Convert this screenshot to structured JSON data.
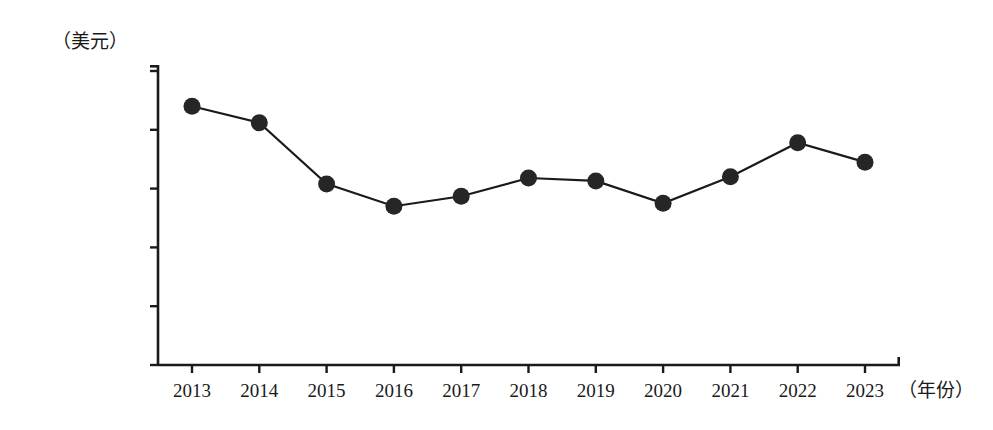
{
  "chart_data": {
    "type": "line",
    "title": "",
    "subtitle": "",
    "xlabel": "（年份）",
    "ylabel": "（美元）",
    "categories": [
      "2013",
      "2014",
      "2015",
      "2016",
      "2017",
      "2018",
      "2019",
      "2020",
      "2021",
      "2022",
      "2023"
    ],
    "values": [
      44000.0,
      41200.0,
      30800.0,
      27000.0,
      28700.0,
      31800.0,
      31300.0,
      27500.0,
      32000.0,
      37800.0,
      34500.0
    ],
    "series": [
      {
        "name": "",
        "values": [
          44000.0,
          41200.0,
          30800.0,
          27000.0,
          28700.0,
          31800.0,
          31300.0,
          27500.0,
          32000.0,
          37800.0,
          34500.0
        ]
      }
    ],
    "ylim": [
      0,
      50000
    ],
    "ytick_values": [
      50000,
      40000,
      30000,
      20000,
      10000,
      0
    ],
    "ytick_labels": [
      "50 000. 00",
      "40 000. 00",
      "30 000. 00",
      "20 000. 00",
      "10 000. 00",
      "0. 00"
    ],
    "xtick_labels": [
      "2013",
      "2014",
      "2015",
      "2016",
      "2017",
      "2018",
      "2019",
      "2020",
      "2021",
      "2022",
      "2023"
    ],
    "grid": false,
    "legend": false,
    "legend_position": "none",
    "marker": "filled-circle",
    "line_color": "#1a1a1a",
    "marker_color": "#262626",
    "axis_color": "#1a1a1a",
    "background_color": "#ffffff"
  },
  "axes": {
    "y_unit_label": "（美元）",
    "x_axis_label": "（年份）"
  }
}
